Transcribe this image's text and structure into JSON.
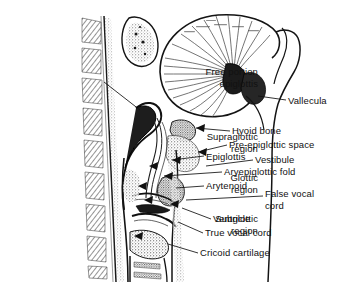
{
  "figure": {
    "background_color": "#ffffff",
    "ink_color": "#111111",
    "width": 341,
    "height": 284
  },
  "labels_left": [
    {
      "id": "free-portion-epiglottis",
      "lines": [
        "Free portion",
        "epiglottis"
      ],
      "right": 258,
      "top": 66,
      "align": "right"
    },
    {
      "id": "supraglottic-region",
      "lines": [
        "Supraglottic",
        "region"
      ],
      "right": 258,
      "top": 131,
      "align": "right"
    },
    {
      "id": "glottic-region",
      "lines": [
        "Glottic",
        "region"
      ],
      "right": 258,
      "top": 172,
      "align": "right"
    },
    {
      "id": "subglottic-region",
      "lines": [
        "Subglottic",
        "region"
      ],
      "right": 258,
      "top": 213,
      "align": "right"
    }
  ],
  "labels_right": [
    {
      "id": "vallecula",
      "lines": [
        "Vallecula"
      ],
      "left": 288,
      "top": 95,
      "align": "left"
    },
    {
      "id": "hyoid-bone",
      "lines": [
        "Hyoid bone"
      ],
      "left": 232,
      "top": 125,
      "align": "left"
    },
    {
      "id": "pre-epiglottic-space",
      "lines": [
        "Pre-epiglottic space"
      ],
      "left": 229,
      "top": 139,
      "align": "left"
    },
    {
      "id": "epiglottis",
      "lines": [
        "Epiglottis"
      ],
      "left": 206,
      "top": 151,
      "align": "left"
    },
    {
      "id": "vestibule",
      "lines": [
        "Vestibule"
      ],
      "left": 255,
      "top": 154,
      "align": "left"
    },
    {
      "id": "aryepiglottic-fold",
      "lines": [
        "Aryepiglottic fold"
      ],
      "left": 224,
      "top": 166,
      "align": "left"
    },
    {
      "id": "arytenoid",
      "lines": [
        "Arytenoid"
      ],
      "left": 206,
      "top": 180,
      "align": "left"
    },
    {
      "id": "false-vocal-cord",
      "lines": [
        "False vocal",
        "cord"
      ],
      "left": 265,
      "top": 188,
      "align": "left"
    },
    {
      "id": "ventricle",
      "lines": [
        "Ventricle"
      ],
      "left": 213,
      "top": 213,
      "align": "left"
    },
    {
      "id": "true-vocal-cord",
      "lines": [
        "True vocal cord"
      ],
      "left": 205,
      "top": 227,
      "align": "left"
    },
    {
      "id": "cricoid-cartilage",
      "lines": [
        "Cricoid cartilage"
      ],
      "left": 200,
      "top": 247,
      "align": "left"
    }
  ]
}
